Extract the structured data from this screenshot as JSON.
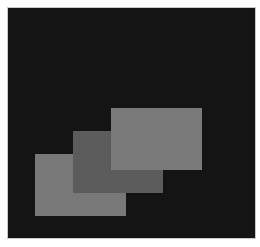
{
  "figure": {
    "background_color": "#141414",
    "border_color": "#c8c8c8",
    "panel": {
      "x": 7,
      "y": 7,
      "width": 247,
      "height": 230
    }
  },
  "shapes": [
    {
      "id": "back-rectangle",
      "x": 27,
      "y": 146,
      "width": 91,
      "height": 62,
      "color": "#787878",
      "z": 1
    },
    {
      "id": "middle-rectangle",
      "x": 65,
      "y": 123,
      "width": 90,
      "height": 62,
      "color": "#5c5c5c",
      "z": 2
    },
    {
      "id": "front-rectangle",
      "x": 103,
      "y": 100,
      "width": 91,
      "height": 62,
      "color": "#7a7a7a",
      "z": 3
    }
  ]
}
